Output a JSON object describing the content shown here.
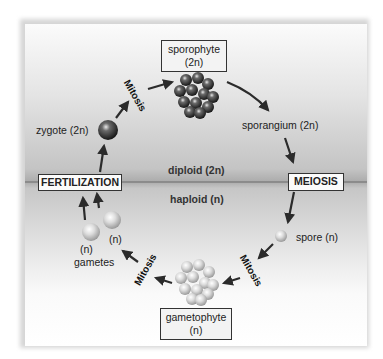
{
  "diagram": {
    "stages": {
      "sporophyte": {
        "name": "sporophyte",
        "ploidy": "(2n)"
      },
      "gametophyte": {
        "name": "gametophyte",
        "ploidy": "(n)"
      }
    },
    "processes": {
      "fertilization": "FERTILIZATION",
      "meiosis": "MEIOSIS",
      "mitosis_top_left": "Mitosis",
      "mitosis_bottom_right": "Mitosis",
      "mitosis_bottom_left": "Mitosis"
    },
    "labels": {
      "zygote": "zygote (2n)",
      "sporangium": "sporangium (2n)",
      "spore": "spore (n)",
      "gamete_n_1": "(n)",
      "gamete_n_2": "(n)",
      "gametes": "gametes"
    },
    "regions": {
      "diploid": "diploid (2n)",
      "haploid": "haploid (n)"
    },
    "colors": {
      "arrow": "#2b2b2b",
      "divider": "#6a6a6a",
      "diploid_cell": "#3a3a3a",
      "haploid_cell": "#d4d4d4"
    }
  }
}
